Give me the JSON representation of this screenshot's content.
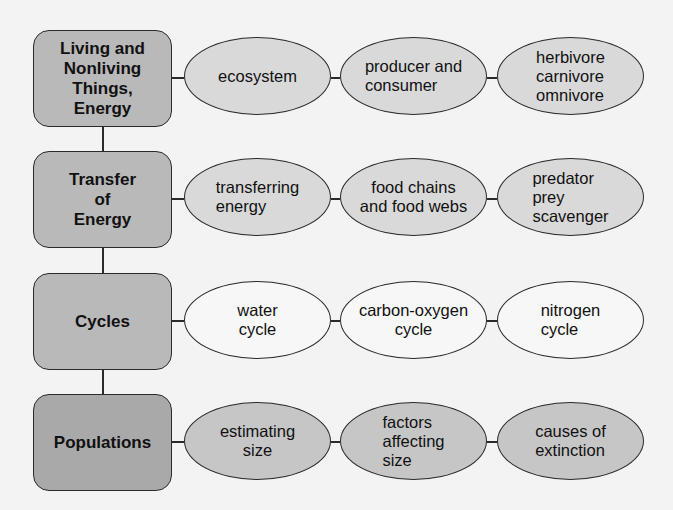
{
  "diagram": {
    "rows": [
      {
        "topic": "Living and\nNonliving\nThings,\nEnergy",
        "concepts": [
          "ecosystem",
          "producer and\nconsumer",
          "herbivore\ncarnivore\nomnivore"
        ],
        "concept_align": [
          "center",
          "left",
          "left"
        ]
      },
      {
        "topic": "Transfer\nof\nEnergy",
        "concepts": [
          "transferring\nenergy",
          "food chains\nand food webs",
          "predator\nprey\nscavenger"
        ],
        "concept_align": [
          "left",
          "center",
          "left"
        ]
      },
      {
        "topic": "Cycles",
        "concepts": [
          "water\ncycle",
          "carbon-oxygen\ncycle",
          "nitrogen\ncycle"
        ],
        "concept_align": [
          "center",
          "center",
          "left"
        ]
      },
      {
        "topic": "Populations",
        "concepts": [
          "estimating\nsize",
          "factors\naffecting\nsize",
          "causes of\nextinction"
        ],
        "concept_align": [
          "center",
          "left",
          "left"
        ]
      }
    ]
  },
  "colors": {
    "background": "#f3f3f3",
    "topic_fill": "#b9b9b9",
    "concept_fill": "#d9d9d9",
    "concept_fill_dark": "#c6c6c6",
    "stroke": "#2a2a2a"
  }
}
